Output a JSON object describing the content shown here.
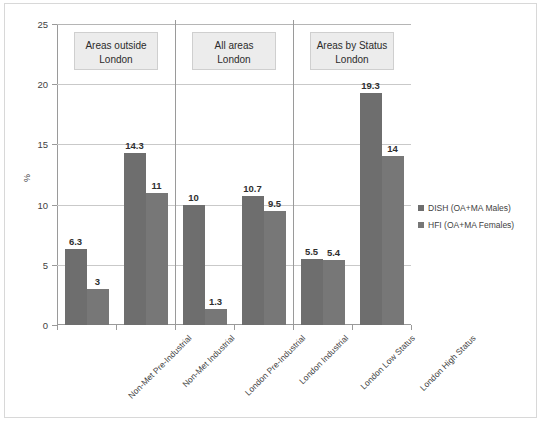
{
  "chart_data": {
    "type": "bar",
    "title": "",
    "xlabel": "",
    "ylabel": "%",
    "ylim": [
      0,
      25
    ],
    "yticks": [
      0,
      5,
      10,
      15,
      20,
      25
    ],
    "grid": true,
    "legend_position": "right",
    "categories": [
      "Non-Met Pre-Industrial",
      "Non-Met Industrial",
      "London Pre-Industrial",
      "London Industrial",
      "London Low Status",
      "London High Status"
    ],
    "series": [
      {
        "name": "DISH (OA+MA Males)",
        "color": "#6e6e6e",
        "values": [
          6.3,
          14.3,
          10,
          10.7,
          5.5,
          19.3
        ],
        "labels": [
          "6.3",
          "14.3",
          "10",
          "10.7",
          "5.5",
          "19.3"
        ]
      },
      {
        "name": "HFI (OA+MA Females)",
        "color": "#777777",
        "values": [
          3,
          11,
          1.3,
          9.5,
          5.4,
          14
        ],
        "labels": [
          "3",
          "11",
          "1.3",
          "9.5",
          "5.4",
          "14"
        ]
      }
    ],
    "groups": [
      {
        "label": "Areas outside\nLondon",
        "categories": [
          "Non-Met Pre-Industrial",
          "Non-Met Industrial"
        ]
      },
      {
        "label": "All areas\nLondon",
        "categories": [
          "London Pre-Industrial",
          "London Industrial"
        ]
      },
      {
        "label": "Areas by Status\nLondon",
        "categories": [
          "London Low Status",
          "London High Status"
        ]
      }
    ]
  }
}
